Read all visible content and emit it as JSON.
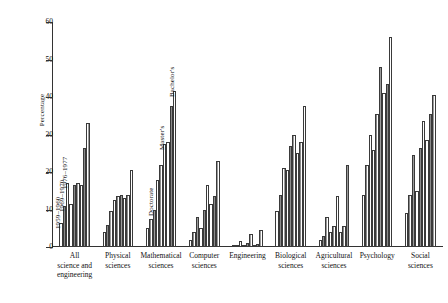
{
  "chart_data": {
    "type": "bar",
    "title": "",
    "subtitle": "",
    "xlabel": "",
    "ylabel": "Percentage",
    "ylim": [
      0,
      60
    ],
    "yticks": [
      0,
      10,
      20,
      30,
      40,
      50,
      60
    ],
    "grid": false,
    "legend_position": "in-plot annotations",
    "categories": [
      "All science and engineering",
      "Physical sciences",
      "Mathematical sciences",
      "Computer sciences",
      "Engineering",
      "Biological sciences",
      "Agricultural sciences",
      "Psychology",
      "Social sciences"
    ],
    "category_lines": [
      [
        "All",
        "science and",
        "engineering"
      ],
      [
        "Physical",
        "sciences"
      ],
      [
        "Mathematical",
        "sciences"
      ],
      [
        "Computer",
        "sciences"
      ],
      [
        "Engineering"
      ],
      [
        "Biological",
        "sciences"
      ],
      [
        "Agricultural",
        "sciences"
      ],
      [
        "Psychology"
      ],
      [
        "Social",
        "sciences"
      ]
    ],
    "degree_levels": [
      "Doctorate",
      "Master's",
      "Bachelor's"
    ],
    "periods": [
      "1959–1960",
      "1969–1970",
      "1976–1977"
    ],
    "annotations": [
      {
        "text": "1959–1960",
        "group": 0,
        "bar": 0
      },
      {
        "text": "1969–1970",
        "group": 0,
        "bar": 1
      },
      {
        "text": "1976–1977",
        "group": 0,
        "bar": 2
      },
      {
        "text": "Doctorate",
        "group": 2,
        "bar": 2
      },
      {
        "text": "Master's",
        "group": 2,
        "bar": 5
      },
      {
        "text": "Bachelor's",
        "group": 2,
        "bar": 8
      }
    ],
    "series": [
      {
        "name": "Doctorate 1959–1960",
        "values": [
          6.5,
          4.0,
          5.0,
          2.0,
          0.3,
          9.5,
          2.0,
          14.0,
          9.0
        ]
      },
      {
        "name": "Doctorate 1969–1970",
        "values": [
          11.0,
          6.0,
          7.5,
          4.0,
          0.5,
          14.0,
          3.0,
          22.0,
          14.0
        ]
      },
      {
        "name": "Doctorate 1976–1977",
        "values": [
          17.0,
          9.5,
          10.0,
          8.0,
          1.5,
          21.0,
          8.0,
          30.0,
          24.5
        ]
      },
      {
        "name": "Master's 1959–1960",
        "values": [
          11.5,
          12.5,
          18.0,
          5.0,
          0.5,
          20.5,
          4.0,
          26.0,
          15.0
        ]
      },
      {
        "name": "Master's 1969–1970",
        "values": [
          16.5,
          13.5,
          22.0,
          10.0,
          1.0,
          27.0,
          5.5,
          35.5,
          26.5
        ]
      },
      {
        "name": "Master's 1976–1977",
        "values": [
          17.0,
          14.0,
          27.5,
          16.5,
          3.5,
          30.0,
          13.5,
          48.0,
          33.5
        ]
      },
      {
        "name": "Bachelor's 1959–1960",
        "values": [
          16.5,
          13.0,
          28.0,
          11.5,
          0.4,
          25.0,
          4.0,
          41.0,
          28.5
        ]
      },
      {
        "name": "Bachelor's 1969–1970",
        "values": [
          26.5,
          14.0,
          37.5,
          13.5,
          0.8,
          28.0,
          5.5,
          43.5,
          35.5
        ]
      },
      {
        "name": "Bachelor's 1976–1977",
        "values": [
          33.0,
          20.5,
          41.5,
          23.0,
          4.5,
          37.5,
          22.0,
          56.0,
          40.5
        ]
      }
    ]
  }
}
